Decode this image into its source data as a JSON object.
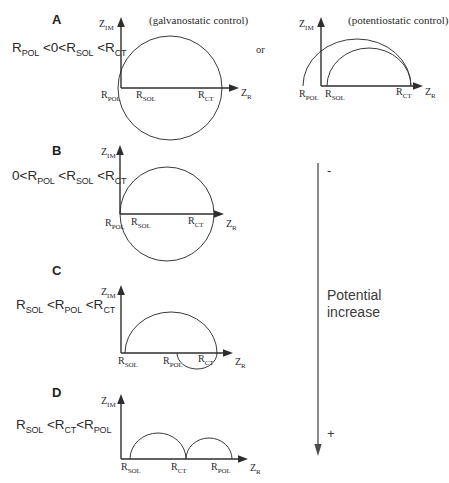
{
  "figure": {
    "type": "nyquist-impedance-diagram",
    "panels": [
      {
        "letter": "A",
        "condition": "R_POL <0<R_SOL <R_CT",
        "condition_parts": [
          "R",
          "POL",
          " <0<",
          "R",
          "SOL",
          " <",
          "R",
          "CT"
        ],
        "plots": [
          {
            "caption": "(galvanostatic control)",
            "y_axis_label": "Z_IM",
            "x_axis_label": "Z_R",
            "tick_labels": [
              "R_POL",
              "R_SOL",
              "R_CT"
            ],
            "shape": "full-circle-crossing-axis"
          },
          {
            "caption": "(potentiostatic control)",
            "y_axis_label": "Z_IM",
            "x_axis_label": "Z_R",
            "tick_labels": [
              "R_POL",
              "R_SOL",
              "R_CT"
            ],
            "shape": "two-overlapping-semicircles"
          }
        ],
        "connector": "or"
      },
      {
        "letter": "B",
        "condition": "0<R_POL <R_SOL <R_CT",
        "plots": [
          {
            "caption": "",
            "y_axis_label": "Z_IM",
            "x_axis_label": "Z_R",
            "tick_labels": [
              "R_POL",
              "R_SOL",
              "R_CT"
            ],
            "shape": "full-circle"
          }
        ]
      },
      {
        "letter": "C",
        "condition": "R_SOL <R_POL <R_CT",
        "plots": [
          {
            "caption": "",
            "y_axis_label": "Z_IM",
            "x_axis_label": "Z_R",
            "tick_labels": [
              "R_SOL",
              "R_POL",
              "R_CT"
            ],
            "shape": "semicircle-with-small-lower-loop"
          }
        ]
      },
      {
        "letter": "D",
        "condition": "R_SOL <R_CT<R_POL",
        "plots": [
          {
            "caption": "",
            "y_axis_label": "Z_IM",
            "x_axis_label": "Z_R",
            "tick_labels": [
              "R_SOL",
              "R_CT",
              "R_POL"
            ],
            "shape": "two-tangent-semicircles"
          }
        ]
      }
    ]
  },
  "potential_axis": {
    "top_sign": "-",
    "bottom_sign": "+",
    "label_line1": "Potential",
    "label_line2": "increase",
    "direction": "downward"
  },
  "labels": {
    "z_im": "Z",
    "z_im_sub": "IM",
    "z_r": "Z",
    "z_r_sub": "R",
    "r": "R",
    "pol": "POL",
    "sol": "SOL",
    "ct": "CT",
    "or": "or",
    "galvanostatic": "(galvanostatic control)",
    "potentiostatic": "(potentiostatic control)"
  },
  "colors": {
    "stroke": "#3a3a3a",
    "axis": "#2e2e2e",
    "text": "#2a2a2a",
    "background": "#ffffff"
  }
}
